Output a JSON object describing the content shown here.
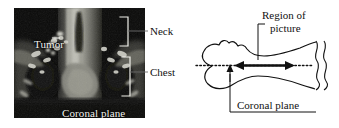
{
  "figure": {
    "kind": "medical-figure-two-panel",
    "background_color": "#ffffff"
  },
  "ct_panel": {
    "name": "coronal-ct-scan",
    "background_color": "#0a0a0a",
    "overlay_text_color": "#f2f2ee",
    "labels": {
      "tumor": "Tumor",
      "coronal_plane": "Coronal plane"
    },
    "brackets": [
      {
        "name": "neck-bracket",
        "label": "Neck"
      },
      {
        "name": "chest-bracket",
        "label": "Chest"
      }
    ]
  },
  "callouts": {
    "neck": "Neck",
    "chest": "Chest"
  },
  "diagram": {
    "name": "body-outline-schematic",
    "line_color": "#111111",
    "labels": {
      "region_of": "Region of",
      "picture": "picture",
      "coronal_plane": "Coronal plane"
    },
    "annotations": {
      "coronal_plane_axis": "dotted horizontal line through body outline",
      "region_extent": "double-headed arrow spanning imaged region",
      "break_marks": "wavy truncation lines at right edge"
    }
  }
}
